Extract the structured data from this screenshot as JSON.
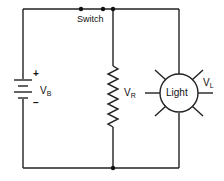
{
  "diagram": {
    "type": "circuit-schematic",
    "components": {
      "battery": {
        "label": "V",
        "subscript": "B",
        "plus": "+",
        "minus": "−"
      },
      "switch": {
        "label": "Switch",
        "state": "closed"
      },
      "resistor": {
        "label": "V",
        "subscript": "R"
      },
      "lamp": {
        "text": "Light",
        "label": "V",
        "subscript": "L"
      }
    },
    "wire_color": "#222222",
    "background": "#ffffff"
  }
}
